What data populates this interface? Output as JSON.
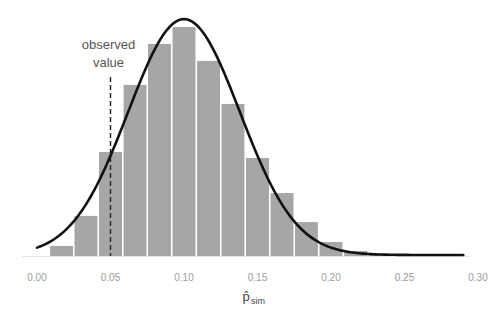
{
  "chart_data": {
    "type": "bar",
    "subtype": "histogram-with-density-curve",
    "title": "",
    "xlabel": "p̂",
    "xlabel_subscript": "sim",
    "ylabel": "",
    "xlim": [
      0.0,
      0.3
    ],
    "x_ticks": [
      "0.00",
      "0.05",
      "0.10",
      "0.15",
      "0.20",
      "0.25",
      "0.30"
    ],
    "x_tick_values": [
      0.0,
      0.05,
      0.1,
      0.15,
      0.2,
      0.25,
      0.3
    ],
    "grid": false,
    "bin_width": 0.01667,
    "bins": [
      {
        "center": 0.0167,
        "relative_height": 0.044
      },
      {
        "center": 0.0333,
        "relative_height": 0.175
      },
      {
        "center": 0.05,
        "relative_height": 0.454
      },
      {
        "center": 0.0667,
        "relative_height": 0.747
      },
      {
        "center": 0.0833,
        "relative_height": 0.926
      },
      {
        "center": 0.1,
        "relative_height": 1.0
      },
      {
        "center": 0.1167,
        "relative_height": 0.852
      },
      {
        "center": 0.1333,
        "relative_height": 0.664
      },
      {
        "center": 0.15,
        "relative_height": 0.428
      },
      {
        "center": 0.1667,
        "relative_height": 0.275
      },
      {
        "center": 0.1833,
        "relative_height": 0.148
      },
      {
        "center": 0.2,
        "relative_height": 0.061
      },
      {
        "center": 0.2167,
        "relative_height": 0.022
      },
      {
        "center": 0.2333,
        "relative_height": 0.005
      }
    ],
    "curve": {
      "type": "normal-density",
      "mean": 0.1,
      "sd": 0.038,
      "peak_relative_height": 1.03,
      "x_range": [
        0.0,
        0.29
      ]
    },
    "reference_line": {
      "x": 0.05,
      "style": "dashed",
      "label_line1": "observed",
      "label_line2": "value"
    },
    "colors": {
      "bar_fill": "#a6a6a6",
      "bar_edge": "#ffffff",
      "curve": "#111111",
      "reference_line": "#222222"
    }
  }
}
